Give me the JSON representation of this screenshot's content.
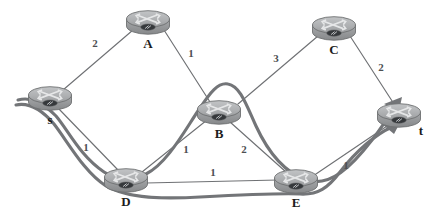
{
  "diagram": {
    "type": "network-flow-graph",
    "width": 439,
    "height": 221,
    "background_color": "#ffffff",
    "node_icon": "router-icon",
    "colors": {
      "edge": "#6f7174",
      "flow_path": "#737578",
      "node_body": "#9a9c9e",
      "node_top": "#b6b8ba",
      "label_text": "#1c1c1c",
      "weight_text": "#4d4f52"
    },
    "nodes": [
      {
        "id": "s",
        "label": "s",
        "x": 50,
        "y": 98,
        "label_dx": 0,
        "label_dy": 17
      },
      {
        "id": "A",
        "label": "A",
        "x": 148,
        "y": 22,
        "label_dx": 0,
        "label_dy": 17
      },
      {
        "id": "C",
        "label": "C",
        "x": 334,
        "y": 28,
        "label_dx": 0,
        "label_dy": 17
      },
      {
        "id": "B",
        "label": "B",
        "x": 219,
        "y": 112,
        "label_dx": 0,
        "label_dy": 17
      },
      {
        "id": "t",
        "label": "t",
        "x": 399,
        "y": 115,
        "label_dx": 22,
        "label_dy": 10
      },
      {
        "id": "D",
        "label": "D",
        "x": 126,
        "y": 180,
        "label_dx": 0,
        "label_dy": 17
      },
      {
        "id": "E",
        "label": "E",
        "x": 296,
        "y": 181,
        "label_dx": 0,
        "label_dy": 17
      }
    ],
    "edges": [
      {
        "id": "s-A",
        "from": "s",
        "to": "A",
        "weight": "2",
        "label_x": 95,
        "label_y": 43
      },
      {
        "id": "A-B",
        "from": "A",
        "to": "B",
        "weight": "1",
        "label_x": 191,
        "label_y": 53
      },
      {
        "id": "B-C",
        "from": "B",
        "to": "C",
        "weight": "3",
        "label_x": 276,
        "label_y": 58
      },
      {
        "id": "C-t",
        "from": "C",
        "to": "t",
        "weight": "2",
        "label_x": 381,
        "label_y": 67
      },
      {
        "id": "s-D",
        "from": "s",
        "to": "D",
        "weight": "1",
        "label_x": 86,
        "label_y": 147
      },
      {
        "id": "D-B",
        "from": "D",
        "to": "B",
        "weight": "1",
        "label_x": 186,
        "label_y": 149
      },
      {
        "id": "B-E",
        "from": "B",
        "to": "E",
        "weight": "2",
        "label_x": 244,
        "label_y": 149
      },
      {
        "id": "D-E",
        "from": "D",
        "to": "E",
        "weight": "1",
        "label_x": 213,
        "label_y": 172
      },
      {
        "id": "E-t",
        "from": "E",
        "to": "t",
        "weight": "1",
        "label_x": 346,
        "label_y": 165
      }
    ],
    "flow_paths": [
      {
        "id": "flow-path-upper",
        "route": "s-D-B-E-t",
        "arrowhead": true
      },
      {
        "id": "flow-path-lower",
        "route": "s-D-E-t",
        "arrowhead": true
      }
    ]
  }
}
